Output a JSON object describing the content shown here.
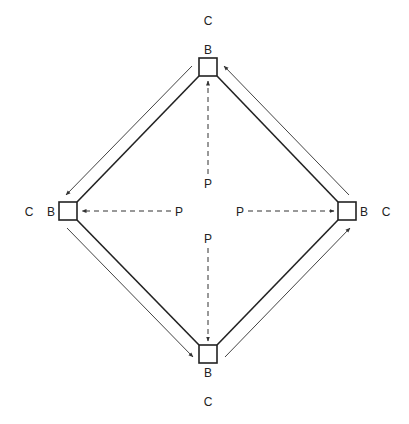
{
  "diagram": {
    "colors": {
      "stroke": "#222222",
      "thin_arrow": "#444444",
      "label": "#222222",
      "background": "#ffffff"
    },
    "nodes": {
      "top": {
        "box_label": "B",
        "outer_label": "C"
      },
      "left": {
        "box_label": "B",
        "outer_label": "C"
      },
      "right": {
        "box_label": "B",
        "outer_label": "C"
      },
      "bottom": {
        "box_label": "B",
        "outer_label": "C"
      }
    },
    "sources": {
      "top": {
        "label": "P",
        "target": "top"
      },
      "left": {
        "label": "P",
        "target": "left"
      },
      "right": {
        "label": "P",
        "target": "right"
      },
      "bottom": {
        "label": "P",
        "target": "bottom"
      }
    },
    "edges": [
      {
        "from": "top",
        "to": "left",
        "style": "solid",
        "flow_arrow": "top→left"
      },
      {
        "from": "left",
        "to": "bottom",
        "style": "solid",
        "flow_arrow": "left→bottom"
      },
      {
        "from": "bottom",
        "to": "right",
        "style": "solid",
        "flow_arrow": "bottom→right"
      },
      {
        "from": "right",
        "to": "top",
        "style": "solid",
        "flow_arrow": "right→top"
      }
    ]
  }
}
